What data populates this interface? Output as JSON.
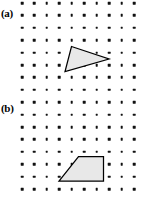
{
  "figure": {
    "width": 142,
    "height": 197,
    "background_color": "#ffffff",
    "dot_color": "#111111",
    "shape_fill_color": "#e8e8e8",
    "shape_stroke_color": "#000000"
  },
  "panels": [
    {
      "id": "a",
      "label": "(a)",
      "label_position": {
        "x": 1,
        "y": 8
      },
      "shape": {
        "name": "triangle",
        "vertices": [
          {
            "x": 71.5,
            "y": 46.5
          },
          {
            "x": 109.0,
            "y": 59.0
          },
          {
            "x": 65.0,
            "y": 71.5
          }
        ]
      }
    },
    {
      "id": "b",
      "label": "(b)",
      "label_position": {
        "x": 1,
        "y": 103
      },
      "shape": {
        "name": "trapezoid",
        "vertices": [
          {
            "x": 78.5,
            "y": 156.5
          },
          {
            "x": 103.5,
            "y": 156.5
          },
          {
            "x": 103.5,
            "y": 181.0
          },
          {
            "x": 59.0,
            "y": 181.0
          }
        ]
      }
    }
  ],
  "chart_data": {
    "type": "scatter",
    "xlabel": "",
    "ylabel": "",
    "grid": false,
    "legend": "none",
    "lattice": {
      "columns": 10,
      "rows": 16,
      "x_start": 22,
      "y_start": 3,
      "x_spacing": 12.45,
      "y_spacing": 12.4,
      "dot_size_px": 2.6
    },
    "annotations": [
      {
        "text": "(a)",
        "x": 1,
        "y": 8
      },
      {
        "text": "(b)",
        "x": 1,
        "y": 103
      }
    ],
    "series": [
      {
        "name": "triangle",
        "panel": "a",
        "x": [
          71.5,
          109.0,
          65.0
        ],
        "y": [
          46.5,
          59.0,
          71.5
        ]
      },
      {
        "name": "trapezoid",
        "panel": "b",
        "x": [
          78.5,
          103.5,
          103.5,
          59.0
        ],
        "y": [
          156.5,
          156.5,
          181.0,
          181.0
        ]
      }
    ]
  }
}
